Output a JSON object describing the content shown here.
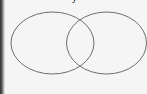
{
  "diagram": {
    "type": "venn",
    "title_fragment": "y",
    "sets": [
      {
        "name": "left-set",
        "cx": 52.5,
        "cy": 43,
        "rx": 41.5,
        "ry": 31
      },
      {
        "name": "right-set",
        "cx": 106.5,
        "cy": 43,
        "rx": 40,
        "ry": 31
      }
    ],
    "stroke_color": "#6e6e6e",
    "background_color": "#f5f5f5"
  }
}
